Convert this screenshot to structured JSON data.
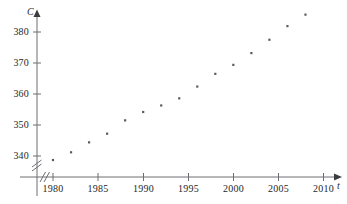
{
  "chart_data": {
    "type": "scatter",
    "title": "",
    "xlabel": "t",
    "ylabel": "C",
    "x": [
      1980,
      1982,
      1984,
      1986,
      1988,
      1990,
      1992,
      1994,
      1996,
      1998,
      2000,
      2002,
      2004,
      2006,
      2008
    ],
    "values": [
      338.7,
      341.2,
      344.4,
      347.2,
      351.5,
      354.2,
      356.3,
      358.6,
      362.4,
      366.5,
      369.4,
      373.2,
      377.5,
      381.9,
      385.6
    ],
    "xlim": [
      1978,
      2011.5
    ],
    "ylim": [
      334,
      389
    ],
    "xticks": [
      1980,
      1985,
      1990,
      1995,
      2000,
      2005,
      2010
    ],
    "xtick_labels": [
      "1980",
      "1985",
      "1990",
      "1995",
      "2000",
      "2005",
      "2010"
    ],
    "yticks": [
      340,
      350,
      360,
      370,
      380
    ],
    "ytick_labels": [
      "340",
      "350",
      "360",
      "370",
      "380"
    ],
    "grid": false,
    "legend": null,
    "axis_break_x": true,
    "axis_break_y": true,
    "marker": "square",
    "marker_color": "#5a5a63",
    "axis_color": "#6e6e72"
  },
  "axes": {
    "y_axis_name": "C",
    "x_axis_name": "t"
  }
}
